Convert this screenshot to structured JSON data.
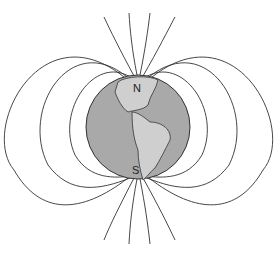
{
  "diagram": {
    "labels": {
      "north": "N",
      "south": "S"
    },
    "colors": {
      "background": "#ffffff",
      "ocean": "#a9a9a9",
      "land": "#cfcfcf",
      "field_line": "#333333"
    }
  }
}
